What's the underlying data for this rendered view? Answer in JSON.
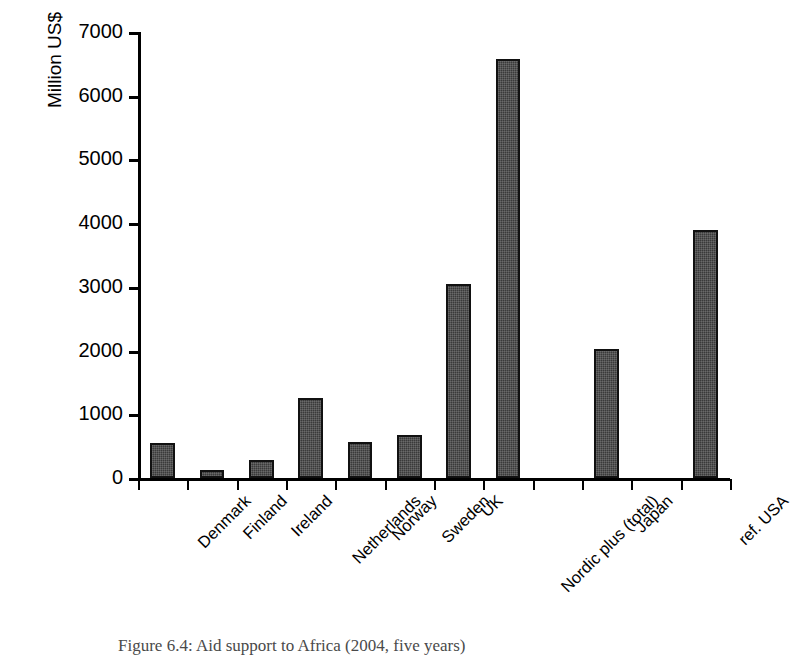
{
  "chart_data": {
    "type": "bar",
    "title": "",
    "xlabel": "",
    "ylabel": "Million US$",
    "ylim": [
      0,
      7000
    ],
    "ytick_labels": [
      "0",
      "1000",
      "2000",
      "3000",
      "4000",
      "5000",
      "6000",
      "7000"
    ],
    "ytick_values": [
      0,
      1000,
      2000,
      3000,
      4000,
      5000,
      6000,
      7000
    ],
    "grid": false,
    "legend": null,
    "categories": [
      "Denmark",
      "Finland",
      "Ireland",
      "Netherlands",
      "Norway",
      "Sweden",
      "UK",
      "Nordic plus (total)",
      "",
      "Japan",
      "",
      "ref. USA"
    ],
    "values": [
      550,
      125,
      290,
      1250,
      570,
      680,
      3050,
      6570,
      null,
      2020,
      null,
      3900
    ],
    "bar_color": "#3a3a3a",
    "bar_edge_color": "#111111"
  },
  "caption": {
    "text": "Figure 6.4: Aid support to Africa (2004, five years)"
  }
}
